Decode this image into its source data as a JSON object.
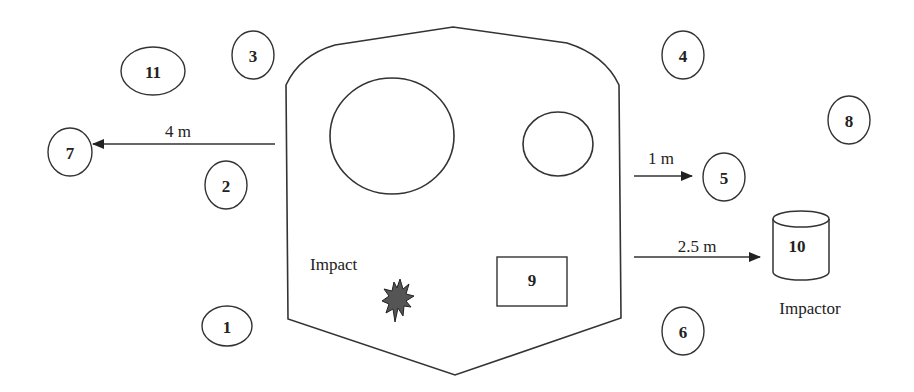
{
  "diagram": {
    "title": "",
    "markers": [
      {
        "id": "1",
        "label": "1",
        "cx": 227,
        "cy": 176,
        "rx": 25,
        "ry": 20
      },
      {
        "id": "2",
        "label": "2",
        "cx": 226,
        "cy": 185,
        "rx": 21,
        "ry": 24
      },
      {
        "id": "3",
        "label": "3",
        "cx": 253,
        "cy": 55,
        "rx": 21,
        "ry": 24
      },
      {
        "id": "4",
        "label": "4",
        "cx": 683,
        "cy": 55,
        "rx": 21,
        "ry": 24
      },
      {
        "id": "5",
        "label": "5",
        "cx": 724,
        "cy": 177,
        "rx": 21,
        "ry": 24
      },
      {
        "id": "6",
        "label": "6",
        "cx": 683,
        "cy": 331,
        "rx": 21,
        "ry": 24
      },
      {
        "id": "7",
        "label": "7",
        "cx": 70,
        "cy": 152,
        "rx": 22,
        "ry": 24
      },
      {
        "id": "8",
        "label": "8",
        "cx": 849,
        "cy": 120,
        "rx": 21,
        "ry": 24
      },
      {
        "id": "9",
        "label": "9"
      },
      {
        "id": "10",
        "label": "10"
      },
      {
        "id": "11",
        "label": "11",
        "cx": 153,
        "cy": 71,
        "rx": 32,
        "ry": 24
      }
    ],
    "arrows": [
      {
        "label": "4 m",
        "direction": "left",
        "target": "7"
      },
      {
        "label": "1 m",
        "direction": "right",
        "target": "5"
      },
      {
        "label": "2.5 m",
        "direction": "right",
        "target": "10"
      }
    ],
    "labels": {
      "impact": "Impact",
      "impactor": "Impactor",
      "marker_1": "1",
      "marker_2": "2",
      "marker_3": "3",
      "marker_4": "4",
      "marker_5": "5",
      "marker_6": "6",
      "marker_7": "7",
      "marker_8": "8",
      "marker_9": "9",
      "marker_10": "10",
      "marker_11": "11",
      "arrow_4m": "4 m",
      "arrow_1m": "1 m",
      "arrow_25m": "2.5 m"
    },
    "colors": {
      "stroke": "#333333",
      "impact_fill": "#555555",
      "background": "#ffffff"
    }
  }
}
